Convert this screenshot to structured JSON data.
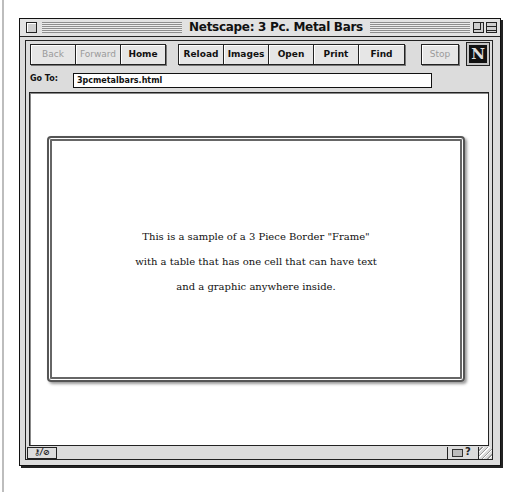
{
  "window": {
    "title": "Netscape: 3 Pc. Metal Bars"
  },
  "toolbar": {
    "buttons": [
      {
        "label": "Back",
        "enabled": false
      },
      {
        "label": "Forward",
        "enabled": false
      },
      {
        "label": "Home",
        "enabled": true
      },
      {
        "label": "Reload",
        "enabled": true
      },
      {
        "label": "Images",
        "enabled": true
      },
      {
        "label": "Open",
        "enabled": true
      },
      {
        "label": "Print",
        "enabled": true
      },
      {
        "label": "Find",
        "enabled": true
      },
      {
        "label": "Stop",
        "enabled": false
      }
    ],
    "logo": "N"
  },
  "location": {
    "label": "Go To:",
    "value": "3pcmetalbars.html"
  },
  "page": {
    "lines": [
      "This is a sample of a 3 Piece Border \"Frame\"",
      "with a table that has one cell that can have text",
      "and a graphic anywhere inside."
    ]
  },
  "status": {
    "security_icon": "broken-key-icon",
    "text": "",
    "icons": [
      "mail-icon",
      "help-icon"
    ]
  },
  "colors": {
    "chrome": "#dcdcdc",
    "border": "#222222",
    "content_bg": "#ffffff"
  }
}
